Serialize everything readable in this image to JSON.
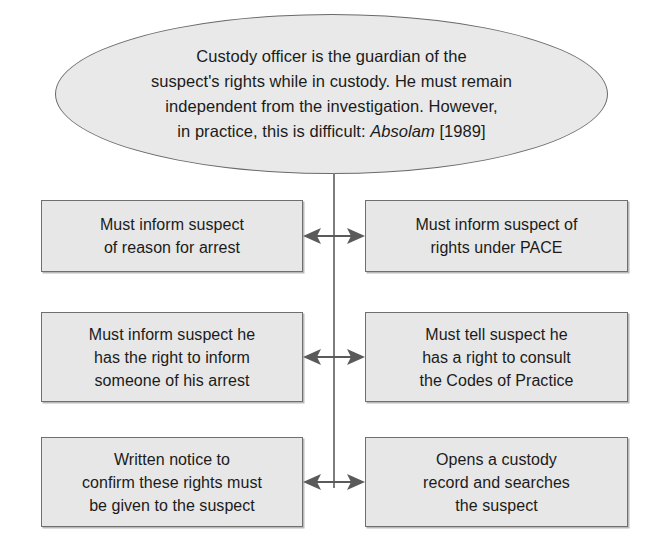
{
  "diagram": {
    "colors": {
      "node_fill": "#e7e7e7",
      "node_border": "#6f6f6f",
      "ellipse_fill": "#e9e9e9",
      "ellipse_border": "#6a6a6a",
      "connector": "#7d7d7d",
      "arrow": "#5a5a5a",
      "text": "#1b1b1b",
      "background": "#ffffff"
    },
    "root": {
      "shape": "ellipse",
      "lines": [
        "Custody officer is the guardian of the",
        "suspect's rights while in custody. He must remain",
        "independent from the investigation. However,",
        "in practice, this is difficult:"
      ],
      "citation_italic": "Absolam",
      "citation_year": "[1989]"
    },
    "rows": [
      {
        "connector": "double-headed-arrow",
        "left": {
          "lines": [
            "Must inform suspect",
            "of reason for arrest"
          ]
        },
        "right": {
          "lines": [
            "Must inform suspect of",
            "rights under PACE"
          ]
        }
      },
      {
        "connector": "double-headed-arrow",
        "left": {
          "lines": [
            "Must inform suspect he",
            "has the right to inform",
            "someone of his arrest"
          ]
        },
        "right": {
          "lines": [
            "Must tell suspect he",
            "has a right to consult",
            "the Codes of Practice"
          ]
        }
      },
      {
        "connector": "double-headed-arrow",
        "left": {
          "lines": [
            "Written notice to",
            "confirm these rights must",
            "be given to the suspect"
          ]
        },
        "right": {
          "lines": [
            "Opens a custody",
            "record and searches",
            "the suspect"
          ]
        }
      }
    ]
  }
}
